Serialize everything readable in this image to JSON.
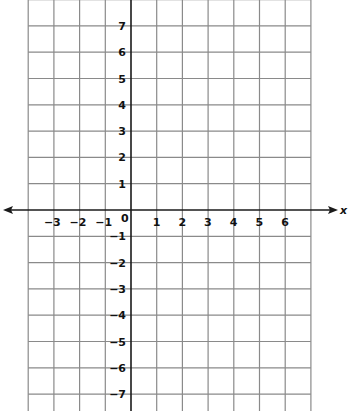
{
  "chart_data": {
    "type": "coordinate-grid",
    "title": "",
    "xlabel": "x",
    "ylabel": "",
    "xlim": [
      -4,
      7
    ],
    "ylim": [
      -7.5,
      7.8
    ],
    "grid": true,
    "x_ticks": [
      -3,
      -2,
      -1,
      1,
      2,
      3,
      4,
      5,
      6
    ],
    "x_tick_labels": [
      "−3",
      "−2",
      "−1",
      "1",
      "2",
      "3",
      "4",
      "5",
      "6"
    ],
    "y_ticks": [
      7,
      6,
      5,
      4,
      3,
      2,
      1,
      -1,
      -2,
      -3,
      -4,
      -5,
      -6,
      -7
    ],
    "y_tick_labels": [
      "7",
      "6",
      "5",
      "4",
      "3",
      "2",
      "1",
      "−1",
      "−2",
      "−3",
      "−4",
      "−5",
      "−6",
      "−7"
    ],
    "origin_label": "0",
    "x_axis_arrows": "both",
    "colors": {
      "grid": "#8a8a8a",
      "axis": "#1a1a1a",
      "text": "#111111"
    }
  }
}
